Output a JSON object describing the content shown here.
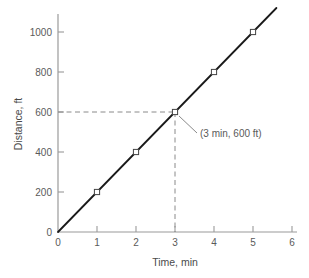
{
  "chart_data": {
    "type": "line",
    "title": "",
    "xlabel": "Time, min",
    "ylabel": "Distance, ft",
    "xlim": [
      0,
      6
    ],
    "ylim": [
      0,
      1100
    ],
    "xticks": [
      0,
      1,
      2,
      3,
      4,
      5,
      6
    ],
    "xtick_labels": [
      "0",
      "1",
      "2",
      "3",
      "4",
      "5",
      "6"
    ],
    "yticks": [
      0,
      200,
      400,
      600,
      800,
      1000
    ],
    "ytick_labels": [
      "0",
      "200",
      "400",
      "600",
      "800",
      "1000"
    ],
    "grid": false,
    "legend": "none",
    "series": [
      {
        "name": "Distance vs Time",
        "marker": "open-square",
        "line_color": "#1a1a1a",
        "x": [
          1,
          2,
          3,
          4,
          5
        ],
        "values": [
          200,
          400,
          600,
          800,
          1000
        ]
      }
    ],
    "line_extends_through_origin": true,
    "slope_ft_per_min": 200,
    "annotations": [
      {
        "text": "(3 min, 600 ft)",
        "point_x": 3,
        "point_y": 600,
        "leader": true
      }
    ],
    "guide_lines": [
      {
        "type": "horizontal-dashed",
        "y": 600,
        "from_x": 0,
        "to_x": 3
      },
      {
        "type": "vertical-dashed",
        "x": 3,
        "from_y": 0,
        "to_y": 600
      }
    ]
  },
  "colors": {
    "axis": "#9a9a9a",
    "line": "#1a1a1a",
    "marker_fill": "#ffffff",
    "marker_stroke": "#444444",
    "dashed_guide": "#8a8a8a",
    "text": "#5a5a5a",
    "background": "#ffffff"
  },
  "ticks": {
    "x": [
      {
        "label": "0",
        "px": 58
      },
      {
        "label": "1",
        "px": 97
      },
      {
        "label": "2",
        "px": 136
      },
      {
        "label": "3",
        "px": 175
      },
      {
        "label": "4",
        "px": 214
      },
      {
        "label": "5",
        "px": 253
      },
      {
        "label": "6",
        "px": 292
      }
    ],
    "y": [
      {
        "label": "0",
        "px": 232
      },
      {
        "label": "200",
        "px": 192
      },
      {
        "label": "400",
        "px": 152
      },
      {
        "label": "600",
        "px": 112
      },
      {
        "label": "800",
        "px": 72
      },
      {
        "label": "1000",
        "px": 32
      }
    ]
  }
}
